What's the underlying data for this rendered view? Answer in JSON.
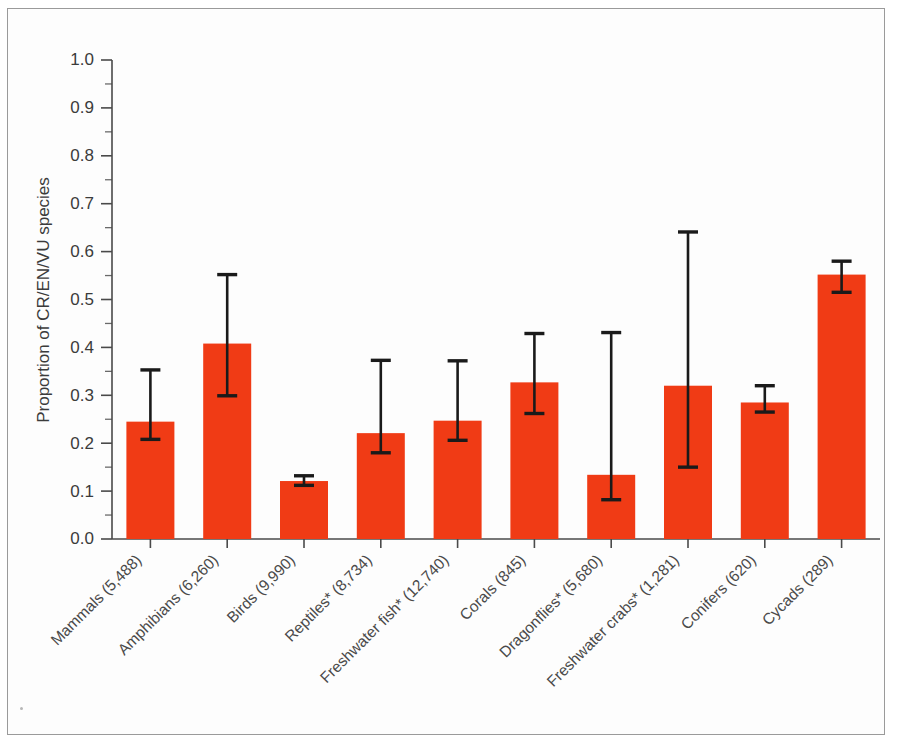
{
  "chart_data": {
    "type": "bar",
    "title": "",
    "xlabel": "",
    "ylabel": "Proportion of CR/EN/VU species",
    "ylim": [
      0,
      1.0
    ],
    "ytick_step": 0.1,
    "yminor_step": 0.05,
    "grid": false,
    "legend": null,
    "bar_color": "#f03b15",
    "error_color": "#1a1a1a",
    "error_type": "asymmetric confidence interval",
    "categories": [
      "Mammals (5,488)",
      "Amphibians (6,260)",
      "Birds (9,990)",
      "Reptiles* (8,734)",
      "Freshwater fish* (12,740)",
      "Corals (845)",
      "Dragonflies* (5,680)",
      "Freshwater crabs* (1,281)",
      "Conifers (620)",
      "Cycads (289)"
    ],
    "group_names": [
      "Mammals",
      "Amphibians",
      "Birds",
      "Reptiles*",
      "Freshwater fish*",
      "Corals",
      "Dragonflies*",
      "Freshwater crabs*",
      "Conifers",
      "Cycads"
    ],
    "species_counts": [
      5488,
      6260,
      9990,
      8734,
      12740,
      845,
      5680,
      1281,
      620,
      289
    ],
    "values": [
      0.245,
      0.408,
      0.121,
      0.221,
      0.247,
      0.327,
      0.134,
      0.32,
      0.285,
      0.552
    ],
    "err_low": [
      0.208,
      0.299,
      0.112,
      0.18,
      0.206,
      0.262,
      0.082,
      0.15,
      0.265,
      0.515
    ],
    "err_high": [
      0.353,
      0.552,
      0.132,
      0.373,
      0.372,
      0.429,
      0.431,
      0.641,
      0.32,
      0.58
    ],
    "ytick_labels": [
      "0.0",
      "0.1",
      "0.2",
      "0.3",
      "0.4",
      "0.5",
      "0.6",
      "0.7",
      "0.8",
      "0.9",
      "1.0"
    ],
    "ytick_values": [
      0.0,
      0.1,
      0.2,
      0.3,
      0.4,
      0.5,
      0.6,
      0.7,
      0.8,
      0.9,
      1.0
    ]
  },
  "figure": {
    "border_color": "#9a9a9a",
    "background": "#ffffff"
  }
}
